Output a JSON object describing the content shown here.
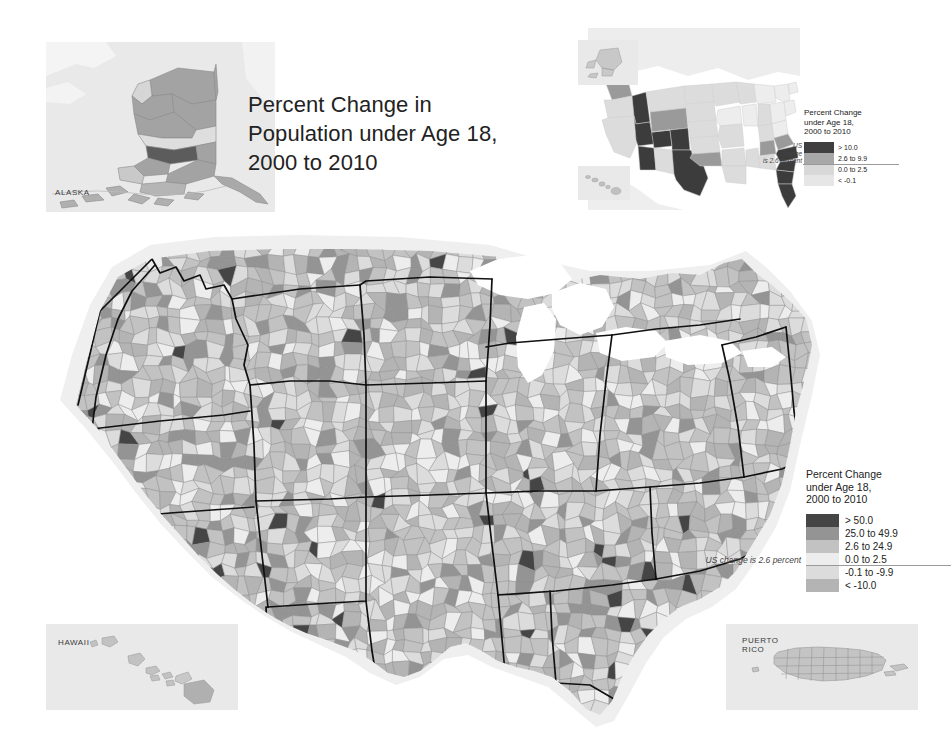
{
  "page": {
    "background": "#ffffff",
    "width": 951,
    "height": 744
  },
  "title": {
    "line1": "Percent Change in",
    "line2": "Population under Age 18,",
    "line3": "2000 to 2010",
    "full": "Percent Change in Population under Age 18, 2000 to 2010"
  },
  "insets": {
    "alaska_label": "ALASKA",
    "hawaii_label": "HAWAII",
    "puerto_rico_label_line1": "PUERTO",
    "puerto_rico_label_line2": "RICO"
  },
  "state_legend": {
    "title_line1": "Percent Change",
    "title_line2": "under Age 18,",
    "title_line3": "2000 to 2010",
    "note_line1": "US",
    "note_line2": "change",
    "note_line3": "is 2.6 percent",
    "note_full": "US change is 2.6 percent",
    "classes": [
      {
        "label": "> 10.0",
        "color": "#3f3f3f"
      },
      {
        "label": "2.6 to 9.9",
        "color": "#a8a8a8"
      },
      {
        "label": "0.0 to 2.5",
        "color": "#d8d8d8"
      },
      {
        "label": "< -0.1",
        "color": "#e6e6e6"
      }
    ]
  },
  "county_legend": {
    "title_line1": "Percent Change",
    "title_line2": "under Age 18,",
    "title_line3": "2000 to 2010",
    "note": "US change is 2.6 percent",
    "classes": [
      {
        "label": "> 50.0",
        "color": "#454545"
      },
      {
        "label": "25.0 to 49.9",
        "color": "#949494"
      },
      {
        "label": "2.6 to 24.9",
        "color": "#c2c2c2"
      },
      {
        "label": "0.0 to 2.5",
        "color": "#ededed"
      },
      {
        "label": "-0.1 to -9.9",
        "color": "#dcdcdc"
      },
      {
        "label": "< -10.0",
        "color": "#b4b4b4"
      }
    ]
  },
  "colors": {
    "ocean": "#ffffff",
    "land_backdrop": "#e9e9e9",
    "state_border": "#111111",
    "county_border": "#8e8e8e",
    "leader_line": "#9a9a9a"
  },
  "chart_data": {
    "type": "choropleth-map",
    "title": "Percent Change in Population under Age 18, 2000 to 2010",
    "units": "percent",
    "national_value": 2.6,
    "geography_levels": [
      "county",
      "state"
    ],
    "county_breaks": [
      {
        "label": "> 50.0",
        "min": 50.0,
        "max": null,
        "color": "#454545"
      },
      {
        "label": "25.0 to 49.9",
        "min": 25.0,
        "max": 49.9,
        "color": "#949494"
      },
      {
        "label": "2.6 to 24.9",
        "min": 2.6,
        "max": 24.9,
        "color": "#c2c2c2"
      },
      {
        "label": "0.0 to 2.5",
        "min": 0.0,
        "max": 2.5,
        "color": "#ededed"
      },
      {
        "label": "-0.1 to -9.9",
        "min": -9.9,
        "max": -0.1,
        "color": "#dcdcdc"
      },
      {
        "label": "< -10.0",
        "min": null,
        "max": -10.0,
        "color": "#b4b4b4"
      }
    ],
    "state_breaks": [
      {
        "label": "> 10.0",
        "min": 10.0,
        "max": null,
        "color": "#3f3f3f"
      },
      {
        "label": "2.6 to 9.9",
        "min": 2.6,
        "max": 9.9,
        "color": "#a8a8a8"
      },
      {
        "label": "0.0 to 2.5",
        "min": 0.0,
        "max": 2.5,
        "color": "#d8d8d8"
      },
      {
        "label": "< -0.1",
        "min": null,
        "max": -0.1,
        "color": "#e6e6e6"
      }
    ],
    "state_classes": {
      "WA": 1,
      "OR": 2,
      "CA": 2,
      "ID": 0,
      "NV": 0,
      "UT": 0,
      "AZ": 0,
      "MT": 2,
      "WY": 1,
      "CO": 0,
      "NM": 2,
      "TX": 0,
      "ND": 2,
      "SD": 2,
      "NE": 2,
      "KS": 2,
      "OK": 1,
      "MN": 2,
      "IA": 3,
      "MO": 2,
      "AR": 2,
      "LA": 2,
      "WI": 2,
      "IL": 3,
      "MS": 2,
      "MI": 3,
      "IN": 2,
      "KY": 2,
      "TN": 1,
      "AL": 2,
      "OH": 3,
      "WV": 3,
      "VA": 1,
      "NC": 0,
      "SC": 0,
      "GA": 0,
      "FL": 0,
      "PA": 3,
      "NY": 3,
      "VT": 3,
      "NH": 2,
      "ME": 3,
      "MA": 2,
      "RI": 3,
      "CT": 2,
      "NJ": 2,
      "DE": 1,
      "MD": 2,
      "AK": 1,
      "HI": 2
    },
    "notes": [
      "Map drawn at county level for the contiguous United States with Alaska, Hawaii and Puerto Rico shown as insets.",
      "State boundaries drawn in heavy black over county fills.",
      "Top-right locator map shows the same measure summarized by state."
    ]
  }
}
